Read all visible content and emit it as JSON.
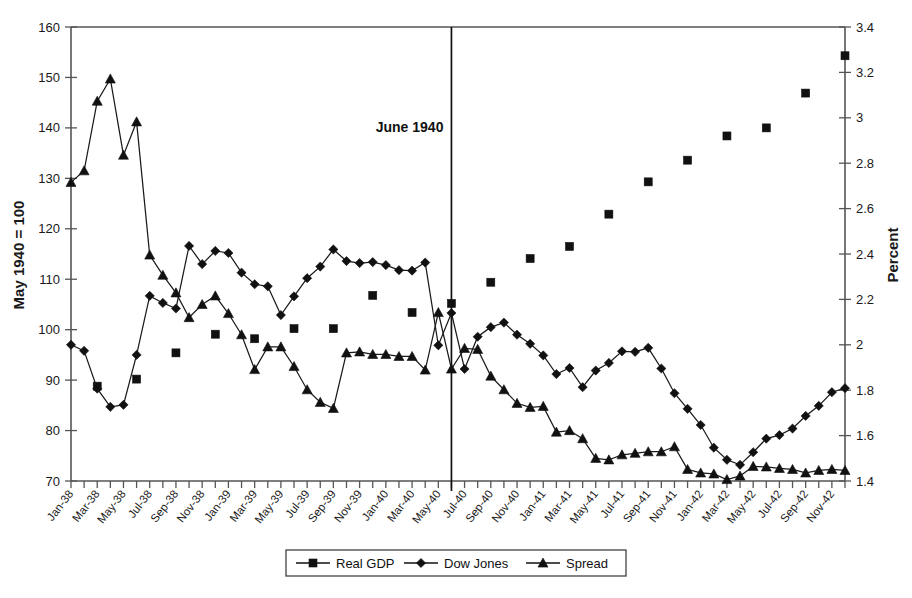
{
  "chart_data": {
    "type": "line",
    "title": "",
    "xlabel": "",
    "ylabel": "May 1940 = 100",
    "y2label": "Percent",
    "ylim": [
      70,
      160
    ],
    "y2lim": [
      1.4,
      3.4
    ],
    "yticks": [
      70,
      80,
      90,
      100,
      110,
      120,
      130,
      140,
      150,
      160
    ],
    "y2ticks": [
      "1.4",
      "1.6",
      "1.8",
      "2",
      "2.2",
      "2.4",
      "2.6",
      "2.8",
      "3",
      "3.2",
      "3.4"
    ],
    "grid": false,
    "legend_position": "bottom",
    "annotations": [
      {
        "text": "June 1940",
        "x": "Jun-40",
        "kind": "vertical-line-label"
      }
    ],
    "x": [
      "Jan-38",
      "Feb-38",
      "Mar-38",
      "Apr-38",
      "May-38",
      "Jun-38",
      "Jul-38",
      "Aug-38",
      "Sep-38",
      "Oct-38",
      "Nov-38",
      "Dec-38",
      "Jan-39",
      "Feb-39",
      "Mar-39",
      "Apr-39",
      "May-39",
      "Jun-39",
      "Jul-39",
      "Aug-39",
      "Sep-39",
      "Oct-39",
      "Nov-39",
      "Dec-39",
      "Jan-40",
      "Feb-40",
      "Mar-40",
      "Apr-40",
      "May-40",
      "Jun-40",
      "Jul-40",
      "Aug-40",
      "Sep-40",
      "Oct-40",
      "Nov-40",
      "Dec-40",
      "Jan-41",
      "Feb-41",
      "Mar-41",
      "Apr-41",
      "May-41",
      "Jun-41",
      "Jul-41",
      "Aug-41",
      "Sep-41",
      "Oct-41",
      "Nov-41",
      "Dec-41",
      "Jan-42",
      "Feb-42",
      "Mar-42",
      "Apr-42",
      "May-42",
      "Jun-42",
      "Jul-42",
      "Aug-42",
      "Sep-42",
      "Oct-42",
      "Nov-42",
      "Dec-42"
    ],
    "xtick_labels": [
      "Jan-38",
      "Mar-38",
      "May-38",
      "Jul-38",
      "Sep-38",
      "Nov-38",
      "Jan-39",
      "Mar-39",
      "May-39",
      "Jul-39",
      "Sep-39",
      "Nov-39",
      "Jan-40",
      "Mar-40",
      "May-40",
      "Jul-40",
      "Sep-40",
      "Nov-40",
      "Jan-41",
      "Mar-41",
      "May-41",
      "Jul-41",
      "Sep-41",
      "Nov-41",
      "Jan-42",
      "Mar-42",
      "May-42",
      "Jul-42",
      "Sep-42",
      "Nov-42"
    ],
    "series": [
      {
        "name": "Real GDP",
        "marker": "square",
        "axis": "left",
        "connected": false,
        "points": [
          {
            "x": "Mar-38",
            "y": 88.8
          },
          {
            "x": "Jun-38",
            "y": 90.2
          },
          {
            "x": "Sep-38",
            "y": 95.4
          },
          {
            "x": "Dec-38",
            "y": 99.1
          },
          {
            "x": "Mar-39",
            "y": 98.2
          },
          {
            "x": "Jun-39",
            "y": 100.2
          },
          {
            "x": "Sep-39",
            "y": 100.2
          },
          {
            "x": "Dec-39",
            "y": 106.8
          },
          {
            "x": "Mar-40",
            "y": 103.4
          },
          {
            "x": "Jun-40",
            "y": 105.2
          },
          {
            "x": "Sep-40",
            "y": 109.4
          },
          {
            "x": "Dec-40",
            "y": 114.1
          },
          {
            "x": "Mar-41",
            "y": 116.5
          },
          {
            "x": "Jun-41",
            "y": 122.9
          },
          {
            "x": "Sep-41",
            "y": 129.3
          },
          {
            "x": "Dec-41",
            "y": 133.6
          },
          {
            "x": "Mar-42",
            "y": 138.4
          },
          {
            "x": "Jun-42",
            "y": 140.0
          },
          {
            "x": "Sep-42",
            "y": 146.9
          },
          {
            "x": "Dec-42",
            "y": 154.3
          }
        ]
      },
      {
        "name": "Dow Jones",
        "marker": "diamond",
        "axis": "left",
        "connected": true,
        "values": [
          97.0,
          95.8,
          88.3,
          84.7,
          85.1,
          95.0,
          106.7,
          105.3,
          104.2,
          116.6,
          113.0,
          115.6,
          115.2,
          111.3,
          109.0,
          108.6,
          102.9,
          106.6,
          110.2,
          112.5,
          115.9,
          113.6,
          113.2,
          113.4,
          112.8,
          111.8,
          111.7,
          113.3,
          96.9,
          103.3,
          92.2,
          98.6,
          100.5,
          101.4,
          99.0,
          97.2,
          94.9,
          91.2,
          92.4,
          88.6,
          91.9,
          93.4,
          95.7,
          95.6,
          96.4,
          92.3,
          87.4,
          84.3,
          81.1,
          76.6,
          74.2,
          73.2,
          75.7,
          78.4,
          79.1,
          80.4,
          82.9,
          84.9,
          87.6,
          88.4
        ]
      },
      {
        "name": "Spread",
        "marker": "triangle",
        "axis": "left",
        "connected": true,
        "values": [
          129.2,
          131.5,
          145.3,
          149.7,
          134.6,
          141.2,
          114.8,
          110.8,
          107.3,
          102.4,
          105.0,
          106.7,
          103.2,
          99.0,
          92.1,
          96.6,
          96.6,
          92.7,
          88.1,
          85.6,
          84.4,
          95.4,
          95.6,
          95.1,
          95.1,
          94.7,
          94.7,
          92.0,
          103.4,
          92.2,
          96.3,
          96.1,
          90.8,
          88.1,
          85.4,
          84.6,
          84.8,
          79.7,
          80.0,
          78.4,
          74.5,
          74.2,
          75.2,
          75.5,
          75.8,
          75.8,
          76.8,
          72.3,
          71.6,
          71.4,
          70.3,
          71.0,
          72.9,
          72.8,
          72.5,
          72.3,
          71.6,
          72.1,
          72.3,
          72.1
        ]
      }
    ]
  },
  "legend": {
    "items": [
      {
        "label": "Real GDP",
        "marker": "square"
      },
      {
        "label": "Dow Jones",
        "marker": "diamond"
      },
      {
        "label": "Spread",
        "marker": "triangle"
      }
    ]
  },
  "axes": {
    "left_title": "May 1940 = 100",
    "right_title": "Percent"
  },
  "colors": {
    "ink": "#1a1a1a",
    "axis": "#555555",
    "background": "#ffffff"
  }
}
